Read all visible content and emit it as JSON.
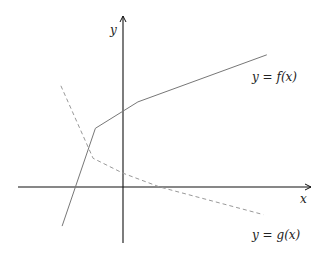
{
  "diagram": {
    "axes": {
      "x_label": "x",
      "y_label": "y"
    },
    "curves": [
      {
        "id": "f",
        "label": "y = f(x)",
        "style": "solid",
        "color": "#777777",
        "points": [
          [
            -5.3,
            -3.4
          ],
          [
            -2.4,
            5.1
          ],
          [
            1.3,
            7.4
          ],
          [
            12.5,
            11.5
          ]
        ]
      },
      {
        "id": "g",
        "label": "y = g(x)",
        "style": "dashed",
        "color": "#999999",
        "points": [
          [
            -5.4,
            8.8
          ],
          [
            -2.6,
            2.5
          ],
          [
            0,
            1.2
          ],
          [
            3.2,
            0
          ],
          [
            12.2,
            -2.4
          ]
        ]
      }
    ]
  }
}
